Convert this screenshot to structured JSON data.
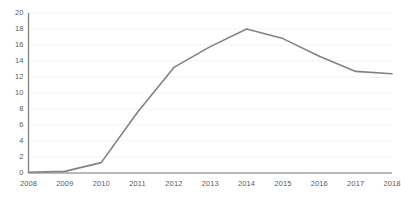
{
  "chart_data": {
    "type": "line",
    "title": "",
    "subtitle": "",
    "xlabel": "",
    "ylabel": "",
    "categories": [
      "2008",
      "2009",
      "2010",
      "2011",
      "2012",
      "2013",
      "2014",
      "2015",
      "2016",
      "2017",
      "2018"
    ],
    "x": [
      2008,
      2009,
      2010,
      2011,
      2012,
      2013,
      2014,
      2015,
      2016,
      2017,
      2018
    ],
    "series": [
      {
        "name": "Series 1",
        "color": "#808285",
        "values": [
          0.1,
          0.2,
          1.3,
          7.6,
          13.2,
          15.8,
          18.0,
          16.8,
          14.6,
          12.7,
          12.4
        ]
      }
    ],
    "ylim": [
      0,
      20
    ],
    "ytick_step": 2,
    "yticks": [
      0,
      2,
      4,
      6,
      8,
      10,
      12,
      14,
      16,
      18,
      20
    ],
    "ytick_labels": [
      "0",
      "2",
      "4",
      "6",
      "8",
      "10",
      "12",
      "14",
      "16",
      "18",
      "20"
    ],
    "grid": true,
    "grid_axis": "y",
    "grid_style": "dotted",
    "grid_color": "#d9d9d9",
    "axis_color": "#808285",
    "legend": false,
    "legend_position": "none",
    "markers": false,
    "line_width": 1.6,
    "annotations": []
  },
  "axes": {
    "y_axis_name": "value-axis",
    "x_axis_name": "year-axis"
  }
}
